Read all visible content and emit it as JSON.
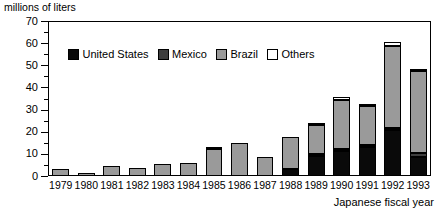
{
  "axis_label_top": "millions of liters",
  "xaxis_title": "Japanese fiscal year",
  "legend": {
    "items": [
      {
        "label": "United States",
        "key": "us",
        "color": "#0a0a0a",
        "swatch_name": "legend-swatch-united-states"
      },
      {
        "label": "Mexico",
        "key": "mx",
        "color": "#3e3e3e",
        "swatch_name": "legend-swatch-mexico"
      },
      {
        "label": "Brazil",
        "key": "br",
        "color": "#9a9a9a",
        "swatch_name": "legend-swatch-brazil"
      },
      {
        "label": "Others",
        "key": "ot",
        "color": "#ffffff",
        "swatch_name": "legend-swatch-others"
      }
    ]
  },
  "yticks": [
    "0",
    "10",
    "20",
    "30",
    "40",
    "50",
    "60",
    "70"
  ],
  "chart_data": {
    "type": "bar",
    "title": "",
    "subtitle": "",
    "xlabel": "Japanese fiscal year",
    "ylabel": "millions of liters",
    "stacked": true,
    "grid": false,
    "legend_position": "inside-top-left",
    "ylim": [
      0,
      70
    ],
    "ytick_step": 10,
    "yminor_step": 5,
    "categories": [
      "1979",
      "1980",
      "1981",
      "1982",
      "1983",
      "1984",
      "1985",
      "1986",
      "1987",
      "1988",
      "1989",
      "1990",
      "1991",
      "1992",
      "1993"
    ],
    "series": [
      {
        "name": "United States",
        "color": "#0a0a0a",
        "values": [
          0.0,
          0.0,
          0.0,
          0.0,
          0.0,
          0.0,
          0.0,
          0.0,
          0.0,
          3.0,
          9.0,
          11.5,
          13.0,
          21.0,
          8.5
        ]
      },
      {
        "name": "Mexico",
        "color": "#3e3e3e",
        "values": [
          0.0,
          0.0,
          0.0,
          0.0,
          0.0,
          0.0,
          0.0,
          0.0,
          0.0,
          0.0,
          0.5,
          0.5,
          0.5,
          0.5,
          2.0
        ]
      },
      {
        "name": "Brazil",
        "color": "#9a9a9a",
        "values": [
          3.0,
          1.5,
          4.5,
          3.5,
          5.5,
          6.0,
          12.0,
          15.0,
          8.5,
          14.5,
          13.0,
          22.0,
          17.5,
          37.0,
          37.0
        ]
      },
      {
        "name": "Others",
        "color": "#ffffff",
        "values": [
          0.0,
          0.0,
          0.0,
          0.0,
          0.0,
          0.0,
          1.0,
          0.0,
          0.0,
          0.0,
          0.5,
          1.5,
          1.0,
          1.5,
          0.5
        ]
      }
    ],
    "totals": [
      3.0,
      1.5,
      4.5,
      3.5,
      5.5,
      6.0,
      13.0,
      15.0,
      8.5,
      17.5,
      23.0,
      35.5,
      32.0,
      60.0,
      48.0
    ]
  }
}
